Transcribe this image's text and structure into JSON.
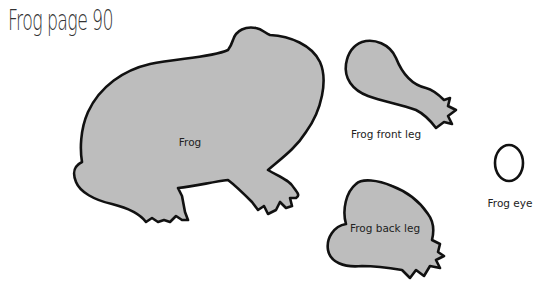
{
  "title": "Frog page 90",
  "pieces": [
    {
      "name": "frog-body",
      "label": "Frog"
    },
    {
      "name": "frog-front-leg",
      "label": "Frog front leg"
    },
    {
      "name": "frog-back-leg",
      "label": "Frog back leg"
    },
    {
      "name": "frog-eye",
      "label": "Frog eye"
    }
  ],
  "colors": {
    "fill": "#bdbdbd",
    "outline": "#111111",
    "background": "#ffffff"
  }
}
